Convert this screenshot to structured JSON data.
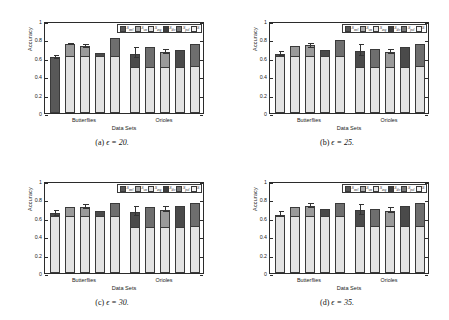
{
  "figure": {
    "panels": [
      {
        "id": "a",
        "caption_label": "(a)",
        "caption_text": "ϵ = 20."
      },
      {
        "id": "b",
        "caption_label": "(b)",
        "caption_text": "ϵ = 25."
      },
      {
        "id": "c",
        "caption_label": "(c)",
        "caption_text": "ϵ = 30."
      },
      {
        "id": "d",
        "caption_label": "(d)",
        "caption_text": "ϵ = 35."
      }
    ]
  },
  "axis": {
    "ylabel": "Accuracy",
    "xlabel": "Data Sets",
    "yticks": [
      "0",
      "0.2",
      "0.4",
      "0.6",
      "0.8",
      "1"
    ],
    "ylim": [
      0,
      1
    ],
    "xticks": [
      "Butterflies",
      "Orioles"
    ]
  },
  "legend": {
    "position": "top-right",
    "entries": [
      {
        "name": "S_mvl",
        "label": "S",
        "sub": "mvl",
        "color": "#555555"
      },
      {
        "name": "S_sm",
        "label": "S",
        "sub": "sm",
        "color": "#a8a8a8"
      },
      {
        "name": "S_avg",
        "label": "S",
        "sub": "avg",
        "color": "#e2e2e2"
      },
      {
        "name": "S_div",
        "label": "S",
        "sub": "div",
        "color": "#3d3d3d"
      },
      {
        "name": "S_pol",
        "label": "S",
        "sub": "pol",
        "color": "#777777"
      },
      {
        "name": "S",
        "label": "S",
        "sub": "",
        "color": "#f2f2f2"
      }
    ]
  },
  "colors": {
    "base_fill": "#e3e3e3",
    "cap_light": "#9a9a9a",
    "cap_dark": "#4a4a4a",
    "solid_dark": "#585858",
    "outline": "#3a3a3a",
    "background": "#ffffff"
  },
  "chart_data": {
    "type": "bar",
    "title": "",
    "xlabel": "Data Sets",
    "ylabel": "Accuracy",
    "ylim": [
      0,
      1
    ],
    "yticks": [
      0,
      0.2,
      0.4,
      0.6,
      0.8,
      1
    ],
    "grid": false,
    "legend_position": "top-right",
    "categories": [
      "Butterflies",
      "Orioles"
    ],
    "series_names": [
      "S_mvl",
      "S_sm",
      "S_avg",
      "S_div",
      "S_pol",
      "S"
    ],
    "panels": [
      {
        "id": "a",
        "epsilon": 20,
        "groups": [
          {
            "category": "Butterflies",
            "bars": [
              {
                "series": "S_mvl",
                "total": 0.61,
                "base": 0.61,
                "cap": 0.0,
                "style": "solid-dark",
                "err_low": 0.585,
                "err_high": 0.635
              },
              {
                "series": "S_sm",
                "total": 0.75,
                "base": 0.62,
                "cap": 0.13,
                "style": "light-cap",
                "err_low": 0.735,
                "err_high": 0.765
              },
              {
                "series": "S_avg",
                "total": 0.725,
                "base": 0.625,
                "cap": 0.1,
                "style": "light-cap",
                "err_low": 0.705,
                "err_high": 0.755
              },
              {
                "series": "S_div",
                "total": 0.655,
                "base": 0.625,
                "cap": 0.03,
                "style": "dark-cap",
                "err_low": null,
                "err_high": null
              },
              {
                "series": "S_pol",
                "total": 0.815,
                "base": 0.62,
                "cap": 0.195,
                "style": "mid-cap",
                "err_low": null,
                "err_high": null
              }
            ]
          },
          {
            "category": "Orioles",
            "bars": [
              {
                "series": "S_mvl",
                "total": 0.645,
                "base": 0.5,
                "cap": 0.145,
                "style": "dark-cap",
                "err_low": 0.6,
                "err_high": 0.72
              },
              {
                "series": "S_sm",
                "total": 0.715,
                "base": 0.505,
                "cap": 0.21,
                "style": "mid-cap",
                "err_low": null,
                "err_high": null
              },
              {
                "series": "S_avg",
                "total": 0.665,
                "base": 0.505,
                "cap": 0.16,
                "style": "light-cap",
                "err_low": 0.645,
                "err_high": 0.695
              },
              {
                "series": "S_div",
                "total": 0.685,
                "base": 0.505,
                "cap": 0.18,
                "style": "dark-cap",
                "err_low": null,
                "err_high": null
              },
              {
                "series": "S_pol",
                "total": 0.75,
                "base": 0.51,
                "cap": 0.24,
                "style": "mid-cap",
                "err_low": null,
                "err_high": null
              }
            ]
          }
        ]
      },
      {
        "id": "b",
        "epsilon": 25,
        "groups": [
          {
            "category": "Butterflies",
            "bars": [
              {
                "series": "S_mvl",
                "total": 0.645,
                "base": 0.625,
                "cap": 0.02,
                "style": "dark-cap",
                "err_low": 0.615,
                "err_high": 0.675
              },
              {
                "series": "S_sm",
                "total": 0.725,
                "base": 0.625,
                "cap": 0.1,
                "style": "light-cap",
                "err_low": null,
                "err_high": null
              },
              {
                "series": "S_avg",
                "total": 0.735,
                "base": 0.625,
                "cap": 0.11,
                "style": "light-cap",
                "err_low": 0.705,
                "err_high": 0.765
              },
              {
                "series": "S_div",
                "total": 0.69,
                "base": 0.625,
                "cap": 0.065,
                "style": "dark-cap",
                "err_low": null,
                "err_high": null
              },
              {
                "series": "S_pol",
                "total": 0.79,
                "base": 0.625,
                "cap": 0.165,
                "style": "mid-cap",
                "err_low": null,
                "err_high": null
              }
            ]
          },
          {
            "category": "Orioles",
            "bars": [
              {
                "series": "S_mvl",
                "total": 0.675,
                "base": 0.505,
                "cap": 0.17,
                "style": "dark-cap",
                "err_low": 0.625,
                "err_high": 0.745
              },
              {
                "series": "S_sm",
                "total": 0.695,
                "base": 0.505,
                "cap": 0.19,
                "style": "mid-cap",
                "err_low": null,
                "err_high": null
              },
              {
                "series": "S_avg",
                "total": 0.665,
                "base": 0.505,
                "cap": 0.16,
                "style": "light-cap",
                "err_low": 0.645,
                "err_high": 0.7
              },
              {
                "series": "S_div",
                "total": 0.72,
                "base": 0.505,
                "cap": 0.215,
                "style": "dark-cap",
                "err_low": null,
                "err_high": null
              },
              {
                "series": "S_pol",
                "total": 0.755,
                "base": 0.51,
                "cap": 0.245,
                "style": "mid-cap",
                "err_low": null,
                "err_high": null
              }
            ]
          }
        ]
      },
      {
        "id": "c",
        "epsilon": 30,
        "groups": [
          {
            "category": "Butterflies",
            "bars": [
              {
                "series": "S_mvl",
                "total": 0.655,
                "base": 0.62,
                "cap": 0.035,
                "style": "dark-cap",
                "err_low": 0.625,
                "err_high": 0.69
              },
              {
                "series": "S_sm",
                "total": 0.72,
                "base": 0.62,
                "cap": 0.1,
                "style": "light-cap",
                "err_low": null,
                "err_high": null
              },
              {
                "series": "S_avg",
                "total": 0.72,
                "base": 0.62,
                "cap": 0.1,
                "style": "light-cap",
                "err_low": 0.7,
                "err_high": 0.755
              },
              {
                "series": "S_div",
                "total": 0.675,
                "base": 0.62,
                "cap": 0.055,
                "style": "dark-cap",
                "err_low": null,
                "err_high": null
              },
              {
                "series": "S_pol",
                "total": 0.765,
                "base": 0.62,
                "cap": 0.145,
                "style": "mid-cap",
                "err_low": null,
                "err_high": null
              }
            ]
          },
          {
            "category": "Orioles",
            "bars": [
              {
                "series": "S_mvl",
                "total": 0.665,
                "base": 0.505,
                "cap": 0.16,
                "style": "dark-cap",
                "err_low": 0.625,
                "err_high": 0.725
              },
              {
                "series": "S_sm",
                "total": 0.72,
                "base": 0.505,
                "cap": 0.215,
                "style": "mid-cap",
                "err_low": null,
                "err_high": null
              },
              {
                "series": "S_avg",
                "total": 0.69,
                "base": 0.505,
                "cap": 0.185,
                "style": "light-cap",
                "err_low": 0.66,
                "err_high": 0.725
              },
              {
                "series": "S_div",
                "total": 0.725,
                "base": 0.505,
                "cap": 0.22,
                "style": "dark-cap",
                "err_low": null,
                "err_high": null
              },
              {
                "series": "S_pol",
                "total": 0.76,
                "base": 0.51,
                "cap": 0.25,
                "style": "mid-cap",
                "err_low": null,
                "err_high": null
              }
            ]
          }
        ]
      },
      {
        "id": "d",
        "epsilon": 35,
        "groups": [
          {
            "category": "Butterflies",
            "bars": [
              {
                "series": "S_mvl",
                "total": 0.635,
                "base": 0.62,
                "cap": 0.015,
                "style": "dark-cap",
                "err_low": 0.605,
                "err_high": 0.675
              },
              {
                "series": "S_sm",
                "total": 0.715,
                "base": 0.62,
                "cap": 0.095,
                "style": "light-cap",
                "err_low": null,
                "err_high": null
              },
              {
                "series": "S_avg",
                "total": 0.73,
                "base": 0.62,
                "cap": 0.11,
                "style": "light-cap",
                "err_low": 0.705,
                "err_high": 0.765
              },
              {
                "series": "S_div",
                "total": 0.7,
                "base": 0.62,
                "cap": 0.08,
                "style": "dark-cap",
                "err_low": null,
                "err_high": null
              },
              {
                "series": "S_pol",
                "total": 0.76,
                "base": 0.62,
                "cap": 0.14,
                "style": "mid-cap",
                "err_low": null,
                "err_high": null
              }
            ]
          },
          {
            "category": "Orioles",
            "bars": [
              {
                "series": "S_mvl",
                "total": 0.685,
                "base": 0.51,
                "cap": 0.175,
                "style": "dark-cap",
                "err_low": 0.635,
                "err_high": 0.755
              },
              {
                "series": "S_sm",
                "total": 0.7,
                "base": 0.51,
                "cap": 0.19,
                "style": "mid-cap",
                "err_low": null,
                "err_high": null
              },
              {
                "series": "S_avg",
                "total": 0.675,
                "base": 0.51,
                "cap": 0.165,
                "style": "light-cap",
                "err_low": 0.655,
                "err_high": 0.715
              },
              {
                "series": "S_div",
                "total": 0.725,
                "base": 0.51,
                "cap": 0.215,
                "style": "dark-cap",
                "err_low": null,
                "err_high": null
              },
              {
                "series": "S_pol",
                "total": 0.765,
                "base": 0.51,
                "cap": 0.255,
                "style": "mid-cap",
                "err_low": null,
                "err_high": null
              }
            ]
          }
        ]
      }
    ]
  }
}
